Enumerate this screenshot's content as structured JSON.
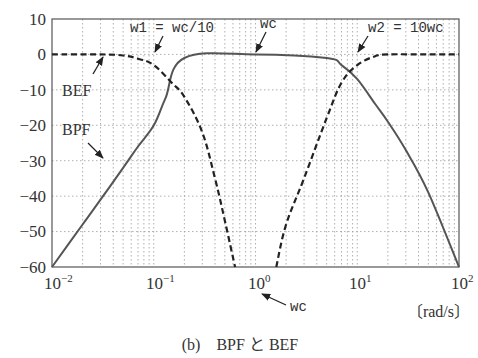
{
  "chart_data": {
    "type": "line",
    "title": "",
    "caption": "(b)　BPF と BEF",
    "xlabel": "〔rad/s〕",
    "ylabel": "",
    "xscale": "log",
    "xlim": [
      0.01,
      100
    ],
    "ylim": [
      -60,
      10
    ],
    "grid": true,
    "x_ticks": [
      "10^-2",
      "10^-1",
      "10^0",
      "10^1",
      "10^2"
    ],
    "y_ticks": [
      "10",
      "0",
      "-10",
      "-20",
      "-30",
      "-40",
      "-50",
      "-60"
    ],
    "series": [
      {
        "name": "BPF",
        "style": "solid",
        "x": [
          0.01,
          0.02,
          0.03,
          0.05,
          0.07,
          0.1,
          0.13,
          0.2,
          1,
          5,
          7,
          10,
          15,
          20,
          30,
          50,
          100
        ],
        "y": [
          -60,
          -48,
          -41,
          -32,
          -26,
          -20,
          -12.5,
          -1,
          0,
          -1,
          -3,
          -7,
          -14,
          -19,
          -27,
          -39,
          -60
        ]
      },
      {
        "name": "BEF",
        "style": "dashed",
        "x": [
          0.01,
          0.03,
          0.05,
          0.07,
          0.1,
          0.15,
          0.2,
          0.3,
          0.4,
          0.5,
          0.63,
          1.6,
          2,
          3,
          5,
          7,
          10,
          15,
          20,
          50,
          100
        ],
        "y": [
          0,
          0,
          -0.3,
          -1.2,
          -3,
          -8,
          -12,
          -22,
          -35,
          -47,
          -60,
          -60,
          -48,
          -35,
          -18,
          -8,
          -3,
          -0.5,
          0,
          0,
          0
        ]
      }
    ],
    "annotations": [
      {
        "text": "w1 = wc/10",
        "x": 0.1,
        "y": 0
      },
      {
        "text": "wc",
        "x": 1,
        "y": 0
      },
      {
        "text": "w2 = 10wc",
        "x": 10,
        "y": 0
      },
      {
        "text": "wc",
        "x": 1,
        "y": -60,
        "note": "arrow to 10^0 tick"
      },
      {
        "text": "BEF",
        "x": 0.02,
        "y": -10
      },
      {
        "text": "BPF",
        "x": 0.02,
        "y": -20
      }
    ]
  },
  "labels": {
    "y_ticks": [
      "10",
      "0",
      "−10",
      "−20",
      "−30",
      "−40",
      "−50",
      "−60"
    ],
    "x_bases": [
      "10",
      "10",
      "10",
      "10",
      "10"
    ],
    "x_exps": [
      "−2",
      "−1",
      "0",
      "1",
      "2"
    ],
    "unit": "〔rad/s〕",
    "caption": "(b)　BPF と BEF",
    "w1": "w1 = wc/10",
    "wc_top": "wc",
    "w2": "w2 = 10wc",
    "wc_bottom": "wc",
    "bef": "BEF",
    "bpf": "BPF"
  }
}
